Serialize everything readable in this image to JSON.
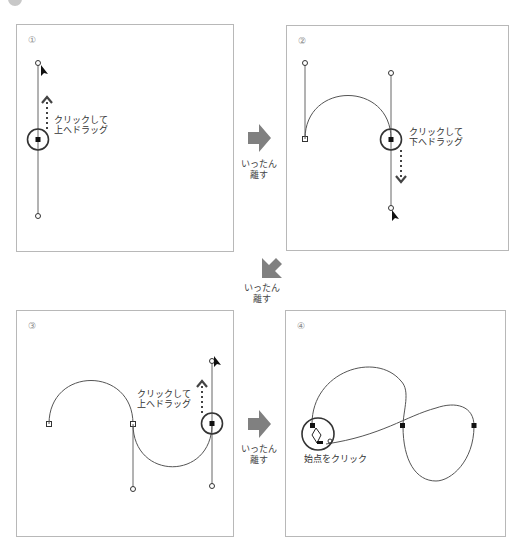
{
  "panels": [
    {
      "number": "①",
      "caption_lines": [
        "クリックして",
        "上へドラッグ"
      ]
    },
    {
      "number": "②",
      "caption_lines": [
        "クリックして",
        "下へドラッグ"
      ]
    },
    {
      "number": "③",
      "caption_lines": [
        "クリックして",
        "上へドラッグ"
      ]
    },
    {
      "number": "④",
      "caption_lines": [
        "始点をクリック"
      ]
    }
  ],
  "transitions": [
    {
      "direction": "right",
      "label_lines": [
        "いったん",
        "離す"
      ]
    },
    {
      "direction": "down-left",
      "label_lines": [
        "いったん",
        "離す"
      ]
    },
    {
      "direction": "right",
      "label_lines": [
        "いったん",
        "離す"
      ]
    }
  ],
  "colors": {
    "arrow": "#808080",
    "path": "#555555",
    "border": "#b8b8b8"
  }
}
